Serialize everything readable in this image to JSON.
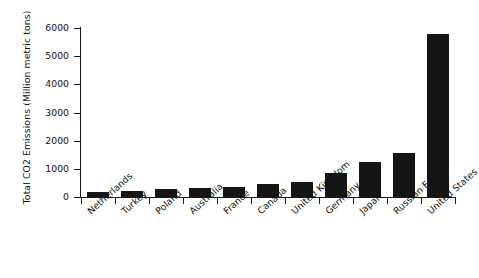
{
  "chart_data": {
    "type": "bar",
    "title": "",
    "xlabel": "",
    "ylabel": "Total CO2 Emissions (Million metric tons)",
    "categories": [
      "Netherlands",
      "Turkey",
      "Poland",
      "Australia",
      "France",
      "Canada",
      "United Kingdom",
      "Germany",
      "Japan",
      "Russian Fed.",
      "United States"
    ],
    "values": [
      190,
      200,
      290,
      330,
      350,
      470,
      530,
      850,
      1240,
      1560,
      5780
    ],
    "ylim": [
      0,
      6000
    ],
    "ytick_labels": [
      "0",
      "1000",
      "2000",
      "3000",
      "4000",
      "5000",
      "6000"
    ],
    "ytick_values": [
      0,
      1000,
      2000,
      3000,
      4000,
      5000,
      6000
    ],
    "grid": false,
    "legend": null,
    "bar_color": "#151515",
    "axis_color": "#1a1a1a"
  }
}
